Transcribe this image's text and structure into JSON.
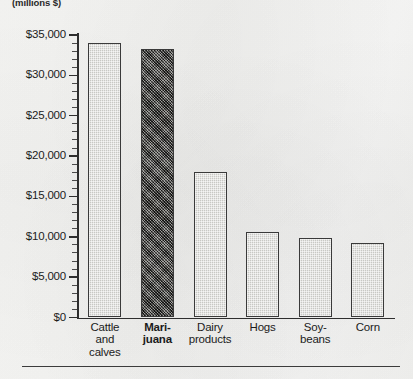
{
  "chart_data": {
    "type": "bar",
    "title": "",
    "subtitle": "",
    "unit_label": "(millions $)",
    "xlabel": "",
    "ylabel": "",
    "categories": [
      "Cattle and calves",
      "Marijuana",
      "Dairy products",
      "Hogs",
      "Soybeans",
      "Corn"
    ],
    "category_lines": [
      [
        "Cattle",
        "and",
        "calves"
      ],
      [
        "Mari-",
        "juana"
      ],
      [
        "Dairy",
        "products"
      ],
      [
        "Hogs"
      ],
      [
        "Soy-",
        "beans"
      ],
      [
        "Corn"
      ]
    ],
    "values": [
      34000,
      33300,
      18000,
      10600,
      9900,
      9200
    ],
    "ylim": [
      0,
      35000
    ],
    "ytick_values": [
      0,
      5000,
      10000,
      15000,
      20000,
      25000,
      30000,
      35000
    ],
    "ytick_labels": [
      "$0",
      "$5,000",
      "$10,000",
      "$15,000",
      "$20,000",
      "$25,000",
      "$30,000",
      "$35,000"
    ],
    "minor_ticks_per_interval": 5,
    "grid": false,
    "legend": null,
    "highlight_index": 1,
    "series": [
      {
        "name": "Value of production",
        "values": [
          34000,
          33300,
          18000,
          10600,
          9900,
          9200
        ]
      }
    ],
    "colors": {
      "bar_light": "#c8c8c4",
      "bar_dark": "#55544f",
      "bar_border": "#3a3a3a",
      "axis": "#2e2e2e",
      "text": "#1b1b1b",
      "paper": "#f4f4f2"
    }
  }
}
